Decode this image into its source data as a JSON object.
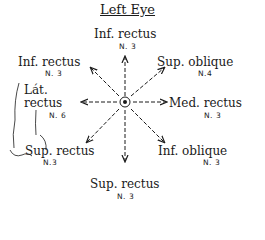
{
  "title": "Left Eye",
  "center": {
    "label": "eye-center",
    "x": 124,
    "y": 103
  },
  "muscles": [
    {
      "id": "top",
      "name": "Inf. rectus",
      "nerve": "N. 3",
      "direction": "up"
    },
    {
      "id": "upper-left",
      "name": "Inf. rectus",
      "nerve": "N. 3",
      "direction": "up-left"
    },
    {
      "id": "upper-right",
      "name": "Sup. oblique",
      "nerve": "N.4",
      "direction": "up-right"
    },
    {
      "id": "left",
      "name_line1": "Lát.",
      "name_line2": "rectus",
      "nerve": "N. 6",
      "direction": "left"
    },
    {
      "id": "right",
      "name": "Med. rectus",
      "nerve": "N. 3",
      "direction": "right"
    },
    {
      "id": "lower-left",
      "name": "Sup. rectus",
      "nerve": "N.3",
      "direction": "down-left"
    },
    {
      "id": "lower-right",
      "name": "Inf. oblique",
      "nerve": "N. 3",
      "direction": "down-right"
    },
    {
      "id": "bottom",
      "name": "Sup. rectus",
      "nerve": "N. 3",
      "direction": "down"
    }
  ],
  "colors": {
    "ink": "#1a1a1a",
    "background": "#ffffff"
  }
}
